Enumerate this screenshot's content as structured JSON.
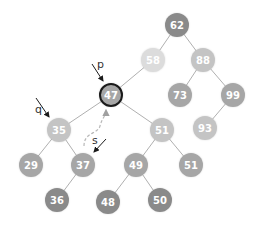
{
  "diagram": {
    "type": "binary-search-tree",
    "nodes": [
      {
        "id": "n62",
        "value": "62",
        "x": 177,
        "y": 25,
        "shade": "dark"
      },
      {
        "id": "n58",
        "value": "58",
        "x": 153,
        "y": 60,
        "shade": "lightest"
      },
      {
        "id": "n88",
        "value": "88",
        "x": 203,
        "y": 60,
        "shade": "light"
      },
      {
        "id": "n47",
        "value": "47",
        "x": 111,
        "y": 95,
        "shade": "medium",
        "highlighted": true
      },
      {
        "id": "n73",
        "value": "73",
        "x": 180,
        "y": 95,
        "shade": "medium"
      },
      {
        "id": "n99",
        "value": "99",
        "x": 233,
        "y": 95,
        "shade": "medium"
      },
      {
        "id": "n35",
        "value": "35",
        "x": 59,
        "y": 130,
        "shade": "light"
      },
      {
        "id": "n51a",
        "value": "51",
        "x": 162,
        "y": 130,
        "shade": "light"
      },
      {
        "id": "n93",
        "value": "93",
        "x": 205,
        "y": 128,
        "shade": "light"
      },
      {
        "id": "n29",
        "value": "29",
        "x": 31,
        "y": 165,
        "shade": "medium"
      },
      {
        "id": "n37",
        "value": "37",
        "x": 83,
        "y": 165,
        "shade": "medium"
      },
      {
        "id": "n49",
        "value": "49",
        "x": 136,
        "y": 165,
        "shade": "medium"
      },
      {
        "id": "n51b",
        "value": "51",
        "x": 191,
        "y": 165,
        "shade": "medium"
      },
      {
        "id": "n36",
        "value": "36",
        "x": 57,
        "y": 200,
        "shade": "dark"
      },
      {
        "id": "n48",
        "value": "48",
        "x": 108,
        "y": 202,
        "shade": "dark"
      },
      {
        "id": "n50",
        "value": "50",
        "x": 160,
        "y": 200,
        "shade": "dark"
      }
    ],
    "edges": [
      [
        "n62",
        "n58"
      ],
      [
        "n62",
        "n88"
      ],
      [
        "n58",
        "n47"
      ],
      [
        "n88",
        "n73"
      ],
      [
        "n88",
        "n99"
      ],
      [
        "n99",
        "n93"
      ],
      [
        "n47",
        "n35"
      ],
      [
        "n47",
        "n51a"
      ],
      [
        "n35",
        "n29"
      ],
      [
        "n35",
        "n37"
      ],
      [
        "n37",
        "n36"
      ],
      [
        "n51a",
        "n49"
      ],
      [
        "n51a",
        "n51b"
      ],
      [
        "n49",
        "n48"
      ],
      [
        "n49",
        "n50"
      ]
    ],
    "pointers": [
      {
        "label": "p",
        "target": "n47"
      },
      {
        "label": "q",
        "target": "n35"
      },
      {
        "label": "s",
        "target": "n37"
      }
    ],
    "dashed_arrow": {
      "from": "n37",
      "to": "n47"
    },
    "colors": {
      "dark": "#8a8a8a",
      "medium": "#a6a6a6",
      "light": "#c4c4c4",
      "lightest": "#dcdcdc",
      "edge": "#b0b0b0",
      "highlight_border": "#1a1a1a",
      "dashed": "#b8b8b8"
    }
  }
}
